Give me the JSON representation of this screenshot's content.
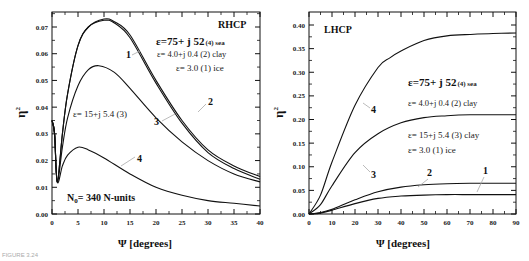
{
  "caption": "FIGURE 3.24",
  "chart_data": [
    {
      "type": "line",
      "title": "RHCP",
      "xlabel": "Ψ [degrees]",
      "ylabel": "η²",
      "xlim": [
        0,
        40
      ],
      "ylim": [
        0.0,
        0.075
      ],
      "xticks": [
        "0",
        "5",
        "10",
        "15",
        "20",
        "25",
        "30",
        "35",
        "40"
      ],
      "yticks": [
        "0.00",
        "0.01",
        "0.02",
        "0.03",
        "0.04",
        "0.05",
        "0.06",
        "0.07"
      ],
      "annotation": "N₀= 340 N-units",
      "legend": [
        {
          "id": "4",
          "text": "ε=75+ j 52 (4) sea"
        },
        {
          "id": "2",
          "text": "ε= 4.0+j 0.4 (2) clay"
        },
        {
          "id": "1",
          "text": "ε= 3.0 (1) ice"
        },
        {
          "id": "3",
          "text": "ε= 15+j 5.4 (3)"
        }
      ],
      "series": [
        {
          "name": "1",
          "x": [
            0,
            0.5,
            1,
            2,
            3,
            5,
            7,
            10,
            12,
            15,
            20,
            25,
            30,
            35,
            40
          ],
          "y": [
            0.035,
            0.03,
            0.012,
            0.03,
            0.045,
            0.063,
            0.07,
            0.073,
            0.072,
            0.067,
            0.05,
            0.035,
            0.024,
            0.018,
            0.014
          ]
        },
        {
          "name": "2",
          "x": [
            0,
            0.5,
            1,
            2,
            3,
            5,
            7,
            10,
            12,
            15,
            20,
            25,
            30,
            35,
            40
          ],
          "y": [
            0.035,
            0.03,
            0.012,
            0.03,
            0.045,
            0.063,
            0.07,
            0.0725,
            0.0715,
            0.066,
            0.049,
            0.034,
            0.023,
            0.017,
            0.013
          ]
        },
        {
          "name": "3",
          "x": [
            0,
            0.5,
            1,
            2,
            3,
            5,
            7,
            9,
            12,
            15,
            20,
            25,
            30,
            35,
            40
          ],
          "y": [
            0.035,
            0.03,
            0.012,
            0.025,
            0.036,
            0.048,
            0.054,
            0.0555,
            0.053,
            0.047,
            0.036,
            0.027,
            0.02,
            0.015,
            0.012
          ]
        },
        {
          "name": "4",
          "x": [
            0,
            0.5,
            1,
            2,
            3,
            5,
            7,
            10,
            15,
            20,
            25,
            30,
            35,
            40
          ],
          "y": [
            0.035,
            0.03,
            0.012,
            0.018,
            0.022,
            0.025,
            0.024,
            0.021,
            0.015,
            0.01,
            0.007,
            0.005,
            0.004,
            0.003
          ]
        }
      ]
    },
    {
      "type": "line",
      "title": "LHCP",
      "xlabel": "Ψ [degrees]",
      "ylabel": "η²",
      "xlim": [
        0,
        90
      ],
      "ylim": [
        0.0,
        0.42
      ],
      "xticks": [
        "0",
        "10",
        "20",
        "30",
        "40",
        "50",
        "60",
        "70",
        "80",
        "90"
      ],
      "yticks": [
        "0.00",
        "0.05",
        "0.10",
        "0.15",
        "0.20",
        "0.25",
        "0.30",
        "0.35",
        "0.40"
      ],
      "legend": [
        {
          "id": "4",
          "text": "ε=75+ j 52 (4) sea"
        },
        {
          "id": "2",
          "text": "ε= 4.0+j 0.4 (2) clay"
        },
        {
          "id": "3",
          "text": "ε= 15+j 5.4 (3) clay"
        },
        {
          "id": "1",
          "text": "ε= 3.0 (1) ice"
        }
      ],
      "series": [
        {
          "name": "1",
          "x": [
            0,
            5,
            10,
            20,
            30,
            40,
            50,
            60,
            70,
            80,
            90
          ],
          "y": [
            0,
            0.002,
            0.008,
            0.022,
            0.033,
            0.038,
            0.04,
            0.041,
            0.041,
            0.041,
            0.041
          ]
        },
        {
          "name": "2",
          "x": [
            0,
            5,
            10,
            20,
            30,
            40,
            50,
            60,
            70,
            80,
            90
          ],
          "y": [
            0,
            0.003,
            0.01,
            0.03,
            0.047,
            0.057,
            0.062,
            0.064,
            0.065,
            0.065,
            0.065
          ]
        },
        {
          "name": "3",
          "x": [
            0,
            5,
            10,
            20,
            30,
            40,
            50,
            60,
            70,
            80,
            90
          ],
          "y": [
            0,
            0.02,
            0.06,
            0.13,
            0.17,
            0.193,
            0.204,
            0.208,
            0.21,
            0.21,
            0.21
          ]
        },
        {
          "name": "4",
          "x": [
            0,
            5,
            10,
            20,
            30,
            35,
            40,
            50,
            60,
            70,
            80,
            90
          ],
          "y": [
            0,
            0.04,
            0.11,
            0.23,
            0.31,
            0.33,
            0.345,
            0.367,
            0.377,
            0.38,
            0.382,
            0.383
          ]
        }
      ]
    }
  ],
  "left": {
    "title": "RHCP",
    "legend1": "ε=75+ j 52",
    "legend1b": "(4) sea",
    "legend2": "ε= 4.0+j 0.4 (2) clay",
    "legend3": "ε= 3.0  (1) ice",
    "legend4": "ε= 15+j 5.4 (3)",
    "n0": "N",
    "n0sub": "0",
    "n0rest": "= 340 N-units",
    "ylabel": "η",
    "ylabelsup": "2",
    "xlabel": "Ψ  [degrees]",
    "labels": [
      "1",
      "2",
      "3",
      "4"
    ]
  },
  "right": {
    "title": "LHCP",
    "legend1": "ε=75+ j 52",
    "legend1b": "(4) sea",
    "legend2": "ε=  4.0+j 0.4 (2) clay",
    "legend3": "ε= 15+j 5.4 (3) clay",
    "legend4": "ε= 3.0  (1) ice",
    "ylabel": "η",
    "ylabelsup": "2",
    "xlabel": "Ψ  [degrees]",
    "labels": [
      "1",
      "2",
      "3",
      "4"
    ]
  }
}
